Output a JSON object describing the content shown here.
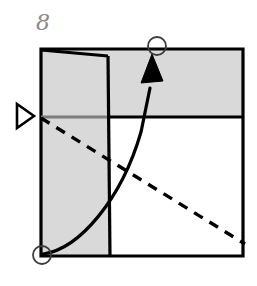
{
  "figure": {
    "kind": "origami-fold-diagram",
    "step_label": "8",
    "canvas": {
      "width": 257,
      "height": 286
    },
    "colors": {
      "paper_fill": "#d9d9d9",
      "paper_white": "#ffffff",
      "stroke": "#000000",
      "crease_gray": "#7d7d7d",
      "label_gray": "#8a8a8a",
      "background": "#ffffff"
    },
    "shapes": {
      "sheet_outline": {
        "name": "square-sheet",
        "points": "41,49 243,49 243,256 41,256"
      },
      "top_band": {
        "name": "folded-top-band",
        "points": "41,49 243,49 243,117 41,117",
        "fill": "paper_fill"
      },
      "left_flap": {
        "name": "folded-left-flap",
        "points": "41,50 108,56 110,256 41,256",
        "fill": "paper_fill"
      },
      "flap_edge_top": {
        "name": "flap-top-edge",
        "from": "41,50",
        "to": "108,56"
      },
      "flap_edge_vertical": {
        "name": "flap-vertical-edge",
        "from": "108,56",
        "to": "110,256"
      },
      "horizontal_crease_gray": {
        "name": "horizontal-crease-gray-segment",
        "from": "41,117",
        "to": "109,117"
      },
      "horizontal_crease_black": {
        "name": "horizontal-crease-black-segment",
        "from": "109,117",
        "to": "243,117"
      },
      "dashed_diagonal": {
        "name": "dashed-fold-line",
        "from": "41,118",
        "to": "244,244",
        "dash": "9 7"
      },
      "curved_arrow": {
        "name": "fold-motion-arrow",
        "path": "M 43,254 C 78,250 120,200 140,130 L 152,84",
        "arrowhead": "147,55 140,80 156,80"
      }
    },
    "markers": {
      "triangle_pointer": {
        "name": "left-edge-triangle-pointer",
        "points": "17,105 33,116 17,127",
        "direction": "right"
      },
      "circle_top": {
        "name": "target-point-circle-top",
        "cx": 157,
        "cy": 46,
        "r": 9
      },
      "circle_bottom_left": {
        "name": "source-point-circle-bottom-left",
        "cx": 42,
        "cy": 255,
        "r": 9
      }
    }
  }
}
